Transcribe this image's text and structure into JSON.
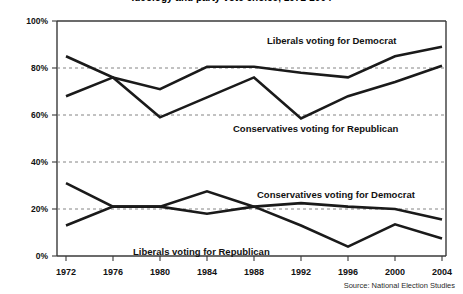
{
  "chart_data": {
    "type": "line",
    "title": "Ideology and party vote choice, 1972-2004",
    "subtitle": "",
    "xlabel": "",
    "ylabel": "",
    "x": [
      1972,
      1976,
      1980,
      1984,
      1988,
      1992,
      1996,
      2000,
      2004
    ],
    "categories": [
      "1972",
      "1976",
      "1980",
      "1984",
      "1988",
      "1992",
      "1996",
      "2000",
      "2004"
    ],
    "xlim": [
      1972,
      2004
    ],
    "ylim": [
      0,
      100
    ],
    "yticks": [
      0,
      20,
      40,
      60,
      80,
      100
    ],
    "ytick_labels": [
      "0%",
      "20%",
      "40%",
      "60%",
      "80%",
      "100%"
    ],
    "grid": "horizontal-dashed",
    "legend": "inline-annotations",
    "series": [
      {
        "name": "Liberals voting for Democrat",
        "values": [
          85,
          76,
          71,
          80.5,
          80.5,
          78,
          76,
          85,
          89
        ],
        "label_text": "Liberals voting for Democrat"
      },
      {
        "name": "Conservatives voting for Republican",
        "values": [
          68,
          76,
          59,
          67.5,
          76,
          58.5,
          68,
          74,
          81
        ],
        "label_text": "Conservatives voting for Republican"
      },
      {
        "name": "Conservatives voting for Democrat",
        "values": [
          13,
          21,
          21,
          18,
          21,
          22.5,
          21,
          20,
          15.5
        ],
        "label_text": "Conservatives voting for Democrat"
      },
      {
        "name": "Liberals voting for Republican",
        "values": [
          31,
          21,
          21,
          27.5,
          21,
          13,
          4,
          13.5,
          7.5
        ],
        "label_text": "Liberals voting for Republican"
      }
    ],
    "annotations": [
      {
        "text": "Liberals voting for Democrat",
        "x_px": 267,
        "y_px": 44
      },
      {
        "text": "Conservatives voting for Republican",
        "x_px": 233,
        "y_px": 132
      },
      {
        "text": "Conservatives voting for Democrat",
        "x_px": 257,
        "y_px": 198
      },
      {
        "text": "Liberals voting for Republican",
        "x_px": 133,
        "y_px": 255
      }
    ],
    "source": "Source: National Election Studies"
  }
}
